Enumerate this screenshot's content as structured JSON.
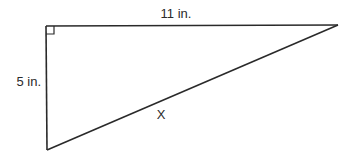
{
  "diagram": {
    "type": "right-triangle",
    "labels": {
      "top_side": "11 in.",
      "left_side": "5 in.",
      "hypotenuse": "X"
    },
    "right_angle_marker": true,
    "stroke_color": "#2a2a2a"
  }
}
